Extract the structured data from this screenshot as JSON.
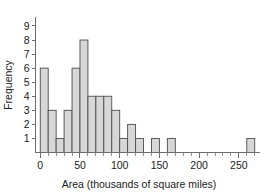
{
  "chart_data": {
    "type": "bar",
    "title": "",
    "subtitle": "",
    "xlabel": "Area (thousands of square miles)",
    "ylabel": "Frequency",
    "xlim": [
      -6,
      276
    ],
    "ylim": [
      0,
      9.6
    ],
    "grid": false,
    "legend": null,
    "bin_width": 10,
    "bin_starts": [
      0,
      10,
      20,
      30,
      40,
      50,
      60,
      70,
      80,
      90,
      100,
      110,
      120,
      130,
      140,
      150,
      160,
      170,
      180,
      190,
      200,
      210,
      220,
      230,
      240,
      250,
      260
    ],
    "categories": [
      "0-10",
      "10-20",
      "20-30",
      "30-40",
      "40-50",
      "50-60",
      "60-70",
      "70-80",
      "80-90",
      "90-100",
      "100-110",
      "110-120",
      "120-130",
      "130-140",
      "140-150",
      "150-160",
      "160-170",
      "170-180",
      "180-190",
      "190-200",
      "200-210",
      "210-220",
      "220-230",
      "230-240",
      "240-250",
      "250-260",
      "260-270"
    ],
    "values": [
      6,
      3,
      1,
      3,
      6,
      8,
      4,
      4,
      4,
      3,
      1,
      2,
      1,
      0,
      1,
      0,
      1,
      0,
      0,
      0,
      0,
      0,
      0,
      0,
      0,
      0,
      1
    ],
    "x_ticks_major": [
      0,
      50,
      100,
      150,
      200,
      250
    ],
    "x_tick_labels": [
      "0",
      "50",
      "100",
      "150",
      "200",
      "250"
    ],
    "x_ticks_minor": [
      10,
      20,
      30,
      40,
      60,
      70,
      80,
      90,
      110,
      120,
      130,
      140,
      160,
      170,
      180,
      190,
      210,
      220,
      230,
      240,
      260,
      270
    ],
    "y_ticks": [
      1,
      2,
      3,
      4,
      5,
      6,
      7,
      8,
      9
    ],
    "y_tick_labels": [
      "1",
      "2",
      "3",
      "4",
      "5",
      "6",
      "7",
      "8",
      "9"
    ],
    "bar_fill_color": "#d7d7d7",
    "bar_edge_color": "#4d4d4d",
    "axis_color": "#6e6e6e",
    "text_color": "#1a1a1a"
  }
}
